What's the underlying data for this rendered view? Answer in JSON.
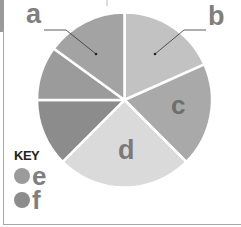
{
  "chart_data": {
    "type": "pie",
    "title": "",
    "start_angle_deg": 0,
    "direction": "clockwise",
    "labels": [
      "b",
      "c",
      "d",
      "f",
      "e",
      "a"
    ],
    "values": [
      18,
      19,
      25,
      12.5,
      10,
      15
    ],
    "angles_deg": [
      66,
      69,
      90,
      45,
      36,
      54
    ],
    "colors": [
      "#c2c2c2",
      "#a9a9a9",
      "#dadada",
      "#8c8c8c",
      "#9b9b9b",
      "#a3a3a3"
    ],
    "direct_labels": [
      "a",
      "b",
      "c",
      "d"
    ],
    "legend": {
      "title": "KEY",
      "position": "bottom-left",
      "entries": [
        {
          "label": "e",
          "color": "#9b9b9b"
        },
        {
          "label": "f",
          "color": "#8c8c8c"
        }
      ]
    }
  },
  "labels": {
    "a": "a",
    "b": "b",
    "c": "c",
    "d": "d"
  },
  "key": {
    "title": "KEY",
    "items": [
      {
        "label": "e",
        "color": "#9b9b9b"
      },
      {
        "label": "f",
        "color": "#8c8c8c"
      }
    ]
  }
}
